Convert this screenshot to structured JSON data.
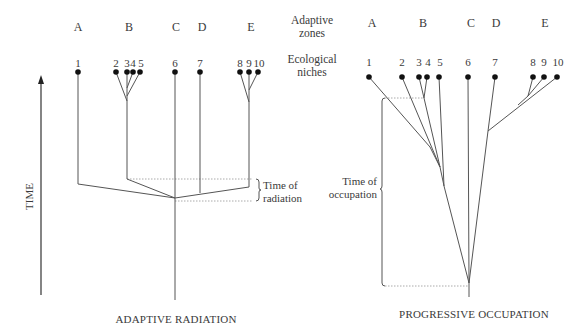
{
  "figure": {
    "row_headers": {
      "zones": "Adaptive\nzones",
      "zones_line1": "Adaptive",
      "zones_line2": "zones",
      "niches_line1": "Ecological",
      "niches_line2": "niches"
    },
    "time_axis_label": "TIME",
    "left_panel": {
      "caption": "ADAPTIVE RADIATION",
      "zones": [
        {
          "label": "A",
          "x": 78
        },
        {
          "label": "B",
          "x": 129
        },
        {
          "label": "C",
          "x": 176
        },
        {
          "label": "D",
          "x": 202
        },
        {
          "label": "E",
          "x": 251
        }
      ],
      "niches": [
        {
          "label": "1",
          "x": 78
        },
        {
          "label": "2",
          "x": 116
        },
        {
          "label": "3",
          "x": 127
        },
        {
          "label": "4",
          "x": 133
        },
        {
          "label": "5",
          "x": 140
        },
        {
          "label": "6",
          "x": 175
        },
        {
          "label": "7",
          "x": 200
        },
        {
          "label": "8",
          "x": 240
        },
        {
          "label": "9",
          "x": 249
        },
        {
          "label": "10",
          "x": 258
        }
      ],
      "annotation_line1": "Time of",
      "annotation_line2": "radiation"
    },
    "right_panel": {
      "caption": "PROGRESSIVE OCCUPATION",
      "zones": [
        {
          "label": "A",
          "x": 372
        },
        {
          "label": "B",
          "x": 423
        },
        {
          "label": "C",
          "x": 471
        },
        {
          "label": "D",
          "x": 496
        },
        {
          "label": "E",
          "x": 545
        }
      ],
      "niches": [
        {
          "label": "1",
          "x": 369
        },
        {
          "label": "2",
          "x": 402
        },
        {
          "label": "3",
          "x": 419
        },
        {
          "label": "4",
          "x": 427
        },
        {
          "label": "5",
          "x": 439
        },
        {
          "label": "6",
          "x": 468
        },
        {
          "label": "7",
          "x": 495
        },
        {
          "label": "8",
          "x": 533
        },
        {
          "label": "9",
          "x": 544
        },
        {
          "label": "10",
          "x": 557
        }
      ],
      "annotation_line1": "Time of",
      "annotation_line2": "occupation"
    },
    "colors": {
      "line": "#555555",
      "dot": "#1a1a1a",
      "dashed": "#9a9a9a",
      "text": "#3a3a3a"
    }
  }
}
